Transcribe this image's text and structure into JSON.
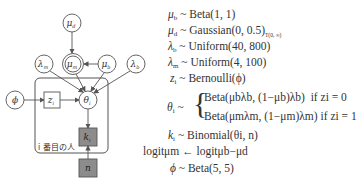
{
  "diagram": {
    "nodes": [
      {
        "id": "mu_d",
        "label": "μ",
        "sub": "d",
        "type": "circle",
        "observed": false
      },
      {
        "id": "lambda_m",
        "label": "λ",
        "sub": "m",
        "type": "circle",
        "observed": false
      },
      {
        "id": "mu_m",
        "label": "μ",
        "sub": "m",
        "type": "double-circle",
        "observed": false
      },
      {
        "id": "mu_b",
        "label": "μ",
        "sub": "b",
        "type": "circle",
        "observed": false
      },
      {
        "id": "lambda_b",
        "label": "λ",
        "sub": "b",
        "type": "circle",
        "observed": false
      },
      {
        "id": "phi",
        "label": "ϕ",
        "sub": "",
        "type": "circle",
        "observed": false
      },
      {
        "id": "z_i",
        "label": "z",
        "sub": "i",
        "type": "square",
        "observed": false
      },
      {
        "id": "theta_i",
        "label": "θ",
        "sub": "i",
        "type": "circle",
        "observed": false
      },
      {
        "id": "k_i",
        "label": "k",
        "sub": "i",
        "type": "square",
        "observed": true
      },
      {
        "id": "n",
        "label": "n",
        "sub": "",
        "type": "square",
        "observed": true
      }
    ],
    "edges": [
      [
        "mu_d",
        "mu_m"
      ],
      [
        "mu_b",
        "mu_m"
      ],
      [
        "lambda_m",
        "theta_i"
      ],
      [
        "mu_m",
        "theta_i"
      ],
      [
        "mu_b",
        "theta_i"
      ],
      [
        "lambda_b",
        "theta_i"
      ],
      [
        "phi",
        "z_i"
      ],
      [
        "z_i",
        "theta_i"
      ],
      [
        "theta_i",
        "k_i"
      ],
      [
        "n",
        "k_i"
      ]
    ],
    "plate_label": "i 番目の人",
    "colors": {
      "stroke": "#555555",
      "observed_fill": "#8c8c8c",
      "background": "#ffffff"
    }
  },
  "equations": {
    "l1": {
      "lhs": "μ",
      "lhs_sub": "b",
      "rel": "~",
      "rhs": "Beta(1, 1)"
    },
    "l2": {
      "lhs": "μ",
      "lhs_sub": "d",
      "rel": "~",
      "rhs": "Gaussian(0, 0.5)",
      "trunc": "T(0, ∞)"
    },
    "l3": {
      "lhs": "λ",
      "lhs_sub": "b",
      "rel": "~",
      "rhs": "Uniform(40, 800)"
    },
    "l4": {
      "lhs": "λ",
      "lhs_sub": "m",
      "rel": "~",
      "rhs": "Uniform(4, 100)"
    },
    "l5": {
      "lhs": "z",
      "lhs_sub": "i",
      "rel": "~",
      "rhs": "Bernoulli(ϕ)"
    },
    "l6": {
      "lhs": "θ",
      "lhs_sub": "i",
      "rel": "~",
      "case0": "Beta(μbλb, (1−μb)λb)",
      "cond0": "if zi = 0",
      "case1": "Beta(μmλm, (1−μm)λm)",
      "cond1": "if zi = 1"
    },
    "l7": {
      "lhs": "k",
      "lhs_sub": "i",
      "rel": "~",
      "rhs": "Binomial(θi, n)"
    },
    "l8": {
      "lhs": "logitμm",
      "rel": "←",
      "rhs": "logitμb−μd"
    },
    "l9": {
      "lhs": "ϕ",
      "rel": "~",
      "rhs": "Beta(5, 5)"
    }
  }
}
